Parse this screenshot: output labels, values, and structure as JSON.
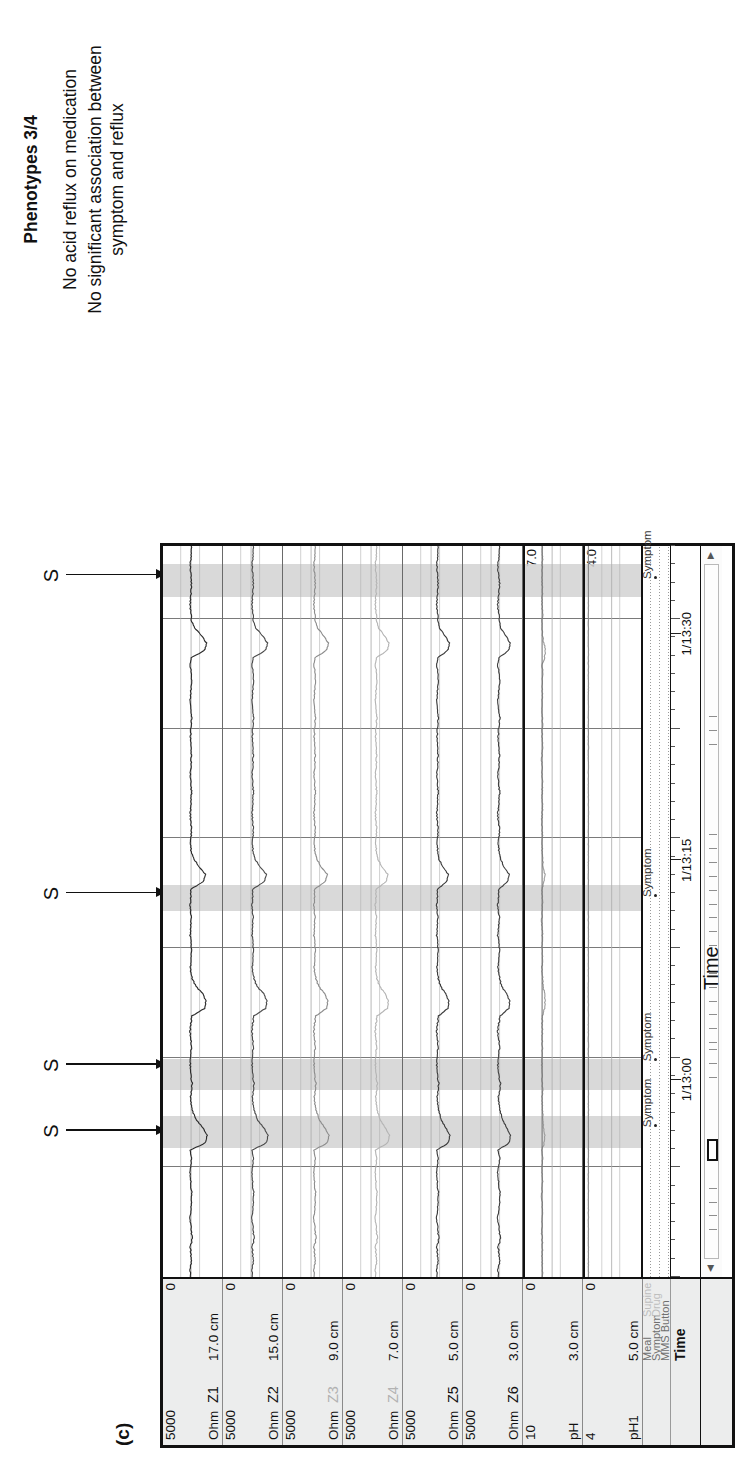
{
  "figure": {
    "panel_label": "(c)",
    "time_axis_title": "Time"
  },
  "caption": {
    "phenotype_title": "Phenotypes 3/4",
    "lines": [
      "No acid reflux on medication",
      "No significant association between symptom and reflux"
    ]
  },
  "annotations": {
    "symptom_marker_letter": "S",
    "markers": [
      {
        "letter": "S",
        "x_pct": 20.0
      },
      {
        "letter": "S",
        "x_pct": 29.0
      },
      {
        "letter": "S",
        "x_pct": 52.5
      },
      {
        "letter": "S",
        "x_pct": 96.0
      }
    ]
  },
  "channels": [
    {
      "unit": "Ohm",
      "name": "Z1",
      "depth": "17.0 cm",
      "hi": "5000",
      "lo": "0",
      "color": "#2b2b2b",
      "faint": false
    },
    {
      "unit": "Ohm",
      "name": "Z2",
      "depth": "15.0 cm",
      "hi": "5000",
      "lo": "0",
      "color": "#4a4a4a",
      "faint": false
    },
    {
      "unit": "Ohm",
      "name": "Z3",
      "depth": "9.0 cm",
      "hi": "5000",
      "lo": "0",
      "color": "#8c8c8c",
      "faint": true
    },
    {
      "unit": "Ohm",
      "name": "Z4",
      "depth": "7.0 cm",
      "hi": "5000",
      "lo": "0",
      "color": "#b4b4b4",
      "faint": true
    },
    {
      "unit": "Ohm",
      "name": "Z5",
      "depth": "5.0 cm",
      "hi": "5000",
      "lo": "0",
      "color": "#3a3a3a",
      "faint": false
    },
    {
      "unit": "Ohm",
      "name": "Z6",
      "depth": "3.0 cm",
      "hi": "5000",
      "lo": "0",
      "color": "#3f3f3f",
      "faint": false
    },
    {
      "unit": "pH",
      "name": "",
      "depth": "3.0 cm",
      "hi": "10",
      "lo": "0",
      "color": "#9b9b9b",
      "faint": false,
      "right_hi": "7.0"
    },
    {
      "unit": "pH1",
      "name": "",
      "depth": "5.0 cm",
      "hi": "4",
      "lo": "0",
      "color": "#cfcfcf",
      "faint": true,
      "right_hi": "4.0"
    }
  ],
  "event_rows": [
    {
      "label_a": "Meal",
      "label_b": "Supine"
    },
    {
      "label_a": "Symptom",
      "label_b": "Drug"
    },
    {
      "label_a": "MMS Button",
      "label_b": ""
    }
  ],
  "event_row_name_labels": [
    "Meal",
    "Symptom",
    "MMS Button"
  ],
  "event_row_value_labels": [
    "Supine",
    "Drug"
  ],
  "symptom_events": [
    {
      "label": "Symptom",
      "x_pct": 20.5
    },
    {
      "label": "Symptom",
      "x_pct": 29.5
    },
    {
      "label": "Symptom",
      "x_pct": 52.0
    },
    {
      "label": "Symptom",
      "x_pct": 95.5
    }
  ],
  "time_row": {
    "name": "Time",
    "ticks": [
      {
        "label": "1/13:00",
        "x_pct": 27.0
      },
      {
        "label": "1/13:15",
        "x_pct": 57.0
      },
      {
        "label": "1/13:30",
        "x_pct": 88.0
      }
    ]
  },
  "scrollbar": {
    "left_arrow": "◀",
    "right_arrow": "▶",
    "thumb_x_pct": 14.0,
    "thumb_w_pct": 3.2
  },
  "reflux_bands": [
    {
      "x_pct": 17.6,
      "w_pct": 4.4
    },
    {
      "x_pct": 25.6,
      "w_pct": 4.2
    },
    {
      "x_pct": 50.0,
      "w_pct": 3.6
    },
    {
      "x_pct": 93.0,
      "w_pct": 4.6
    }
  ],
  "chart_data": {
    "type": "line",
    "xlabel": "Time",
    "ylabel": "Impedance (Ohm) / pH",
    "x_range": [
      "1/12:52",
      "1/13:34"
    ],
    "x_tick_labels": [
      "1/13:00",
      "1/13:15",
      "1/13:30"
    ],
    "grid": true,
    "legend": "none",
    "series": [
      {
        "name": "Z1",
        "unit": "Ohm",
        "depth_cm": 17.0,
        "ylim": [
          0,
          5000
        ],
        "baseline_ohm": 2400,
        "values": [
          2450,
          2500,
          2390,
          2420,
          2480,
          2300,
          2350,
          2420,
          2500,
          2450,
          2380,
          2300,
          2410,
          2460,
          2500,
          2420,
          2380,
          2460,
          900,
          700,
          1100,
          1800,
          2200,
          2400,
          2450,
          2380,
          2300,
          2420,
          2500,
          2460,
          2400,
          2380,
          2440,
          2500,
          2420,
          2300,
          1000,
          800,
          1200,
          1900,
          2300,
          2420,
          2470,
          2400,
          2350,
          2440,
          2500,
          2420,
          2380,
          2460,
          2500,
          2440,
          2400,
          1100,
          900,
          1500,
          2100,
          2400,
          2450,
          2400,
          2360,
          2430,
          2490,
          2450,
          2400,
          2360,
          2420,
          2480,
          2440,
          2400,
          2350,
          2420,
          2480,
          2440,
          2400,
          2360,
          2430,
          2490,
          2450,
          2400,
          2360,
          2420,
          2480,
          2440,
          1000,
          750,
          1300,
          2000,
          2350,
          2440,
          2500,
          2450,
          2400,
          2360,
          2430,
          2490,
          2450,
          2400,
          2380
        ]
      },
      {
        "name": "Z2",
        "unit": "Ohm",
        "depth_cm": 15.0,
        "ylim": [
          0,
          5000
        ],
        "baseline_ohm": 2200,
        "values": [
          2250,
          2300,
          2180,
          2220,
          2280,
          2100,
          2150,
          2220,
          2300,
          2250,
          2180,
          2100,
          2210,
          2260,
          2300,
          2220,
          2180,
          2260,
          800,
          600,
          1000,
          1700,
          2000,
          2200,
          2250,
          2180,
          2100,
          2220,
          2300,
          2260,
          2200,
          2180,
          2240,
          2300,
          2220,
          2100,
          900,
          700,
          1100,
          1800,
          2100,
          2220,
          2270,
          2200,
          2150,
          2240,
          2300,
          2220,
          2180,
          2260,
          2300,
          2240,
          2200,
          1000,
          800,
          1400,
          2000,
          2200,
          2250,
          2200,
          2160,
          2230,
          2290,
          2250,
          2200,
          2160,
          2220,
          2280,
          2240,
          2200,
          2150,
          2220,
          2280,
          2240,
          2200,
          2160,
          2230,
          2290,
          2250,
          2200,
          2160,
          2220,
          2280,
          2240,
          900,
          650,
          1200,
          1900,
          2150,
          2240,
          2300,
          2250,
          2200,
          2160,
          2230,
          2290,
          2250,
          2200,
          2180
        ]
      },
      {
        "name": "Z3",
        "unit": "Ohm",
        "depth_cm": 9.0,
        "ylim": [
          0,
          5000
        ],
        "baseline_ohm": 2000,
        "values": [
          2050,
          2100,
          1980,
          2020,
          2080,
          1900,
          1950,
          2020,
          2100,
          2050,
          1980,
          1900,
          2010,
          2060,
          2100,
          2020,
          1980,
          2060,
          700,
          500,
          900,
          1500,
          1800,
          2000,
          2050,
          1980,
          1900,
          2020,
          2100,
          2060,
          2000,
          1980,
          2040,
          2100,
          2020,
          1900,
          800,
          600,
          1000,
          1600,
          1900,
          2020,
          2070,
          2000,
          1950,
          2040,
          2100,
          2020,
          1980,
          2060,
          2100,
          2040,
          2000,
          900,
          700,
          1300,
          1800,
          2000,
          2050,
          2000,
          1960,
          2030,
          2090,
          2050,
          2000,
          1960,
          2020,
          2080,
          2040,
          2000,
          1950,
          2020,
          2080,
          2040,
          2000,
          1960,
          2030,
          2090,
          2050,
          2000,
          1960,
          2020,
          2080,
          2040,
          800,
          550,
          1100,
          1700,
          1950,
          2040,
          2100,
          2050,
          2000,
          1960,
          2030,
          2090,
          2050,
          2000,
          1980
        ]
      },
      {
        "name": "Z4",
        "unit": "Ohm",
        "depth_cm": 7.0,
        "ylim": [
          0,
          5000
        ],
        "baseline_ohm": 1850,
        "values": [
          1900,
          1950,
          1830,
          1870,
          1930,
          1750,
          1800,
          1870,
          1950,
          1900,
          1830,
          1750,
          1860,
          1910,
          1950,
          1870,
          1830,
          1910,
          650,
          450,
          850,
          1400,
          1700,
          1850,
          1900,
          1830,
          1750,
          1870,
          1950,
          1910,
          1850,
          1830,
          1890,
          1950,
          1870,
          1750,
          700,
          550,
          950,
          1500,
          1800,
          1870,
          1920,
          1850,
          1800,
          1890,
          1950,
          1870,
          1830,
          1910,
          1950,
          1890,
          1850,
          800,
          650,
          1200,
          1700,
          1850,
          1900,
          1850,
          1810,
          1880,
          1940,
          1900,
          1850,
          1810,
          1870,
          1930,
          1890,
          1850,
          1800,
          1870,
          1930,
          1890,
          1850,
          1810,
          1880,
          1940,
          1900,
          1850,
          1810,
          1870,
          1930,
          1890,
          700,
          500,
          1000,
          1600,
          1800,
          1890,
          1950,
          1900,
          1850,
          1810,
          1880,
          1940,
          1900,
          1850,
          1830
        ]
      },
      {
        "name": "Z5",
        "unit": "Ohm",
        "depth_cm": 5.0,
        "ylim": [
          0,
          5000
        ],
        "baseline_ohm": 1700,
        "values": [
          1750,
          1800,
          1680,
          1720,
          1780,
          1600,
          1650,
          1720,
          1800,
          1750,
          1680,
          1600,
          1710,
          1760,
          1800,
          1720,
          1680,
          1760,
          600,
          400,
          800,
          1300,
          1550,
          1700,
          1750,
          1680,
          1600,
          1720,
          1800,
          1760,
          1700,
          1680,
          1740,
          1800,
          1720,
          1600,
          650,
          500,
          900,
          1400,
          1650,
          1720,
          1770,
          1700,
          1650,
          1740,
          1800,
          1720,
          1680,
          1760,
          1800,
          1740,
          1700,
          750,
          600,
          1100,
          1600,
          1700,
          1750,
          1700,
          1660,
          1730,
          1790,
          1750,
          1700,
          1660,
          1720,
          1780,
          1740,
          1700,
          1650,
          1720,
          1780,
          1740,
          1700,
          1660,
          1730,
          1790,
          1750,
          1700,
          1660,
          1720,
          1780,
          1740,
          650,
          450,
          950,
          1500,
          1650,
          1740,
          1800,
          1750,
          1700,
          1660,
          1730,
          1790,
          1750,
          1700,
          1680
        ]
      },
      {
        "name": "Z6",
        "unit": "Ohm",
        "depth_cm": 3.0,
        "ylim": [
          0,
          5000
        ],
        "baseline_ohm": 1550,
        "values": [
          1600,
          1680,
          1500,
          1560,
          1650,
          1430,
          1500,
          1600,
          1700,
          1620,
          1500,
          1420,
          1560,
          1640,
          1700,
          1580,
          1490,
          1640,
          500,
          350,
          700,
          1150,
          1420,
          1560,
          1640,
          1500,
          1420,
          1580,
          1700,
          1620,
          1560,
          1500,
          1620,
          1700,
          1580,
          1430,
          550,
          400,
          800,
          1300,
          1500,
          1600,
          1680,
          1560,
          1490,
          1620,
          1700,
          1580,
          1500,
          1640,
          1700,
          1620,
          1560,
          650,
          500,
          1000,
          1400,
          1560,
          1640,
          1560,
          1490,
          1620,
          1700,
          1620,
          1560,
          1490,
          1600,
          1680,
          1620,
          1560,
          1490,
          1600,
          1680,
          1620,
          1560,
          1490,
          1620,
          1700,
          1620,
          1560,
          1490,
          1600,
          1680,
          1620,
          550,
          380,
          850,
          1380,
          1500,
          1620,
          1700,
          1620,
          1560,
          1490,
          1620,
          1700,
          1620,
          1560,
          1520
        ]
      },
      {
        "name": "pH",
        "unit": "pH",
        "depth_cm": 3.0,
        "ylim": [
          0,
          10
        ],
        "reference_line": 7.0,
        "values": [
          6.9,
          6.9,
          7.0,
          7.0,
          6.9,
          7.0,
          7.1,
          7.0,
          6.9,
          7.0,
          7.0,
          7.1,
          7.0,
          6.9,
          7.0,
          7.0,
          6.9,
          7.0,
          6.6,
          6.4,
          6.6,
          6.8,
          6.9,
          7.0,
          7.0,
          6.9,
          7.0,
          7.0,
          7.1,
          7.0,
          6.9,
          7.0,
          7.0,
          6.9,
          7.0,
          6.9,
          6.5,
          6.3,
          6.5,
          6.8,
          6.9,
          7.0,
          7.0,
          6.9,
          7.0,
          7.0,
          6.9,
          7.0,
          7.1,
          7.0,
          6.9,
          7.0,
          7.0,
          6.6,
          6.4,
          6.7,
          6.9,
          7.0,
          7.0,
          6.9,
          7.0,
          7.1,
          7.0,
          6.9,
          7.0,
          7.0,
          6.9,
          7.0,
          7.0,
          7.1,
          7.0,
          6.9,
          7.0,
          7.0,
          6.9,
          7.0,
          7.1,
          7.0,
          6.9,
          7.0,
          7.0,
          6.9,
          7.0,
          6.5,
          6.3,
          6.6,
          6.9,
          7.0,
          7.0,
          6.9,
          7.0,
          7.0,
          6.9,
          7.0,
          7.1,
          7.0,
          6.9,
          7.0,
          7.0
        ]
      },
      {
        "name": "pH1",
        "unit": "pH1",
        "depth_cm": 5.0,
        "ylim": [
          0,
          4
        ],
        "reference_line": 4.0,
        "values": [
          4.0,
          4.0,
          4.0,
          4.0,
          4.0,
          4.0,
          4.0,
          4.0,
          4.0,
          4.0,
          4.0,
          4.0,
          4.0,
          4.0,
          4.0,
          4.0,
          4.0,
          4.0,
          4.0,
          4.0,
          4.0,
          4.0,
          4.0,
          4.0,
          4.0,
          4.0,
          4.0,
          4.0,
          4.0,
          4.0,
          4.0,
          4.0,
          4.0,
          4.0,
          4.0,
          4.0,
          4.0,
          4.0,
          4.0,
          4.0,
          4.0,
          4.0,
          4.0,
          4.0,
          4.0,
          4.0,
          4.0,
          4.0,
          4.0,
          4.0,
          4.0,
          4.0,
          4.0,
          4.0,
          4.0,
          4.0,
          4.0,
          4.0,
          4.0,
          4.0,
          4.0,
          4.0,
          4.0,
          4.0,
          4.0,
          4.0,
          4.0,
          4.0,
          4.0,
          4.0,
          4.0,
          4.0,
          4.0,
          4.0,
          4.0,
          4.0,
          4.0,
          4.0,
          4.0,
          4.0,
          4.0,
          4.0,
          4.0,
          4.0,
          4.0,
          4.0,
          4.0,
          4.0,
          4.0,
          4.0,
          4.0,
          4.0,
          4.0,
          4.0,
          4.0,
          4.0,
          4.0,
          4.0,
          4.0
        ]
      }
    ],
    "annotations": [
      {
        "text": "S",
        "meaning": "symptom event marker",
        "count": 4
      },
      {
        "text": "Symptom",
        "count": 4
      }
    ]
  }
}
